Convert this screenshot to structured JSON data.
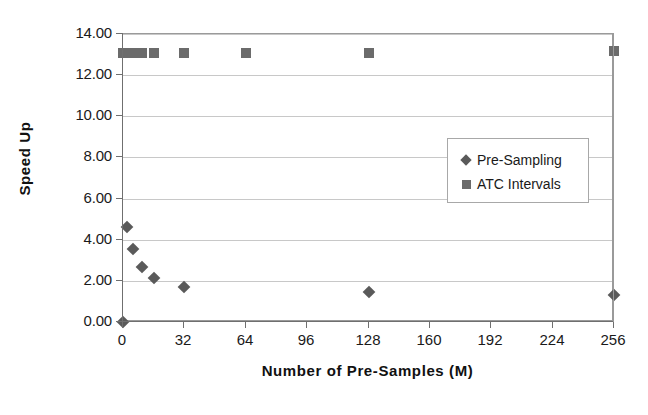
{
  "chart_data": {
    "type": "scatter",
    "title": "",
    "xlabel": "Number of Pre-Samples (M)",
    "ylabel": "Speed Up",
    "xlim": [
      0,
      256
    ],
    "ylim": [
      0,
      14
    ],
    "xticks": [
      "0",
      "32",
      "64",
      "96",
      "128",
      "160",
      "192",
      "224",
      "256"
    ],
    "xtick_values": [
      0,
      32,
      64,
      96,
      128,
      160,
      192,
      224,
      256
    ],
    "yticks": [
      "0.00",
      "2.00",
      "4.00",
      "6.00",
      "8.00",
      "10.00",
      "12.00",
      "14.00"
    ],
    "ytick_values": [
      0,
      2,
      4,
      6,
      8,
      10,
      12,
      14
    ],
    "grid": "horizontal",
    "legend_position": "inside-right",
    "series": [
      {
        "name": "Pre-Sampling",
        "marker": "diamond",
        "color": "#5a5a5a",
        "points": [
          {
            "x": 0,
            "y": 0.0
          },
          {
            "x": 2,
            "y": 4.6
          },
          {
            "x": 5,
            "y": 3.55
          },
          {
            "x": 10,
            "y": 2.65
          },
          {
            "x": 16,
            "y": 2.15
          },
          {
            "x": 32,
            "y": 1.72
          },
          {
            "x": 128,
            "y": 1.45
          },
          {
            "x": 256,
            "y": 1.32
          }
        ]
      },
      {
        "name": "ATC Intervals",
        "marker": "square",
        "color": "#6b6b6b",
        "points": [
          {
            "x": 0,
            "y": 13.1
          },
          {
            "x": 2,
            "y": 13.1
          },
          {
            "x": 5,
            "y": 13.1
          },
          {
            "x": 10,
            "y": 13.1
          },
          {
            "x": 16,
            "y": 13.1
          },
          {
            "x": 32,
            "y": 13.1
          },
          {
            "x": 64,
            "y": 13.1
          },
          {
            "x": 128,
            "y": 13.1
          },
          {
            "x": 256,
            "y": 13.15
          }
        ]
      }
    ]
  },
  "legend": {
    "items": [
      {
        "label": "Pre-Sampling",
        "marker": "diamond"
      },
      {
        "label": "ATC Intervals",
        "marker": "square"
      }
    ]
  }
}
